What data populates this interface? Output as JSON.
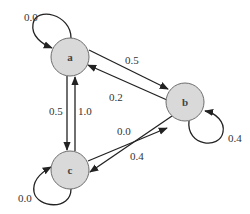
{
  "diagram": {
    "type": "state-transition-graph",
    "colors": {
      "node_fill": "#d9d9d9",
      "node_stroke": "#6e6e6e",
      "edge": "#222222",
      "text": "#333333"
    },
    "nodes": [
      {
        "id": "a",
        "label": "a"
      },
      {
        "id": "b",
        "label": "b"
      },
      {
        "id": "c",
        "label": "c"
      }
    ],
    "edges": [
      {
        "from": "a",
        "to": "a",
        "weight": "0.0"
      },
      {
        "from": "a",
        "to": "b",
        "weight": "0.5"
      },
      {
        "from": "b",
        "to": "a",
        "weight": "0.2"
      },
      {
        "from": "a",
        "to": "c",
        "weight": "0.5"
      },
      {
        "from": "c",
        "to": "a",
        "weight": "1.0"
      },
      {
        "from": "c",
        "to": "b",
        "weight": "0.0"
      },
      {
        "from": "b",
        "to": "c",
        "weight": "0.4"
      },
      {
        "from": "b",
        "to": "b",
        "weight": "0.4"
      },
      {
        "from": "c",
        "to": "c",
        "weight": "0.0"
      }
    ]
  }
}
